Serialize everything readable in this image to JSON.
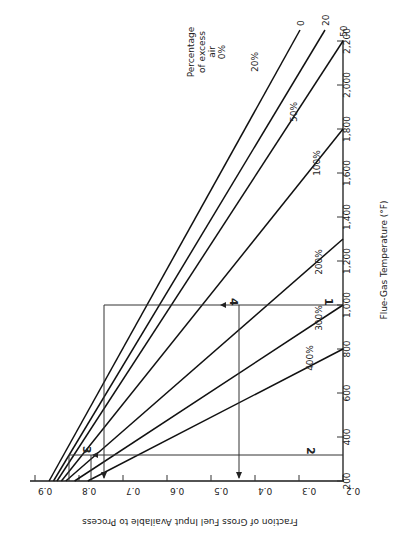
{
  "chart_data": {
    "type": "line",
    "title": "",
    "orientation": "rotated 90deg counter-clockwise",
    "xlabel": "Flue-Gas Temperature (°F)",
    "ylabel": "Fraction of Gross Fuel Input Available to Process",
    "xlim": [
      200,
      2200
    ],
    "ylim": [
      0.2,
      0.9
    ],
    "x_ticks": [
      "200",
      "400",
      "600",
      "800",
      "1,000",
      "1,200",
      "1,400",
      "1,600",
      "1,800",
      "2,000",
      "2,200"
    ],
    "y_ticks": [
      "0.2",
      "0.3",
      "0.4",
      "0.5",
      "0.6",
      "0.7",
      "0.8",
      "0.9"
    ],
    "grid": false,
    "legend_title": "Percentage of excess air",
    "series": [
      {
        "name": "0%",
        "label": "0%",
        "end_label": "0",
        "x": [
          200,
          2450
        ],
        "y": [
          0.868,
          0.2
        ]
      },
      {
        "name": "20%",
        "label": "20%",
        "end_label": "20",
        "x": [
          200,
          2400
        ],
        "y": [
          0.858,
          0.2
        ]
      },
      {
        "name": "50%",
        "label": "50%",
        "end_label": "50",
        "x": [
          200,
          2200
        ],
        "y": [
          0.85,
          0.2
        ]
      },
      {
        "name": "100%",
        "label": "100%",
        "x": [
          200,
          1800
        ],
        "y": [
          0.84,
          0.2
        ]
      },
      {
        "name": "200%",
        "label": "200%",
        "x": [
          200,
          1300
        ],
        "y": [
          0.83,
          0.2
        ]
      },
      {
        "name": "300%",
        "label": "300%",
        "x": [
          200,
          1000
        ],
        "y": [
          0.81,
          0.2
        ]
      },
      {
        "name": "400%",
        "label": "400%",
        "x": [
          200,
          800
        ],
        "y": [
          0.78,
          0.2
        ]
      }
    ],
    "annotations": [
      {
        "label": "1",
        "description": "vertical guide at 1,000°F meeting 300% line"
      },
      {
        "label": "2",
        "description": "horizontal guide at ~260°F from axis"
      },
      {
        "label": "3",
        "description": "guide at ~0.775 fraction near 260°F"
      },
      {
        "label": "4",
        "description": "guide at 1,000°F meeting 100% line at ~0.37"
      }
    ],
    "guide_readings": [
      {
        "fraction": 0.665,
        "note": "arrow down to fraction axis"
      },
      {
        "fraction": 0.37,
        "note": "arrow down to fraction axis"
      }
    ]
  },
  "labels": {
    "legend_line1": "Percentage",
    "legend_line2": "of excess",
    "legend_line3": "air",
    "legend_line4": "0%",
    "ann1": "1",
    "ann2": "2",
    "ann3": "3",
    "ann4": "4"
  }
}
